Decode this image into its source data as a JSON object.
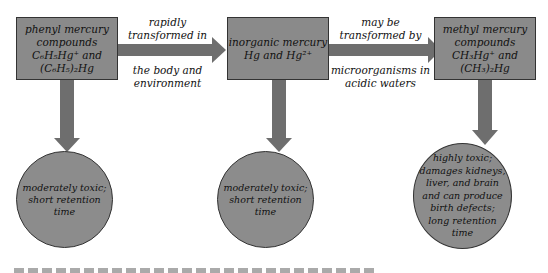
{
  "diagram": {
    "nodes": [
      {
        "id": "phenyl",
        "lines": [
          "phenyl mercury",
          "compounds",
          "C₆H₅Hg⁺ and",
          "(C₆H₅)₂Hg"
        ]
      },
      {
        "id": "inorganic",
        "lines": [
          "inorganic mercury",
          "Hg and Hg²⁺"
        ]
      },
      {
        "id": "methyl",
        "lines": [
          "methyl mercury",
          "compounds",
          "CH₃Hg⁺ and",
          "(CH₃)₂Hg"
        ]
      }
    ],
    "edges": [
      {
        "from": "phenyl",
        "to": "inorganic",
        "label_top": [
          "rapidly",
          "transformed in"
        ],
        "label_bottom": [
          "the body and",
          "environment"
        ]
      },
      {
        "from": "inorganic",
        "to": "methyl",
        "label_top": [
          "may be",
          "transformed by"
        ],
        "label_bottom": [
          "microorganisms in",
          "acidic waters"
        ]
      }
    ],
    "outcomes": [
      {
        "for": "phenyl",
        "lines": [
          "moderately toxic;",
          "short retention time"
        ]
      },
      {
        "for": "inorganic",
        "lines": [
          "moderately toxic;",
          "short retention time"
        ]
      },
      {
        "for": "methyl",
        "lines": [
          "highly toxic;",
          "damages kidneys,",
          "liver, and brain",
          "and can produce",
          "birth defects;",
          "long retention",
          "time"
        ]
      }
    ],
    "colors": {
      "fill": "#8a8a8a",
      "arrow": "#6e6e6e",
      "border": "#333333"
    }
  }
}
